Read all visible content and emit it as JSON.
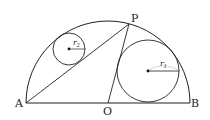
{
  "diagram": {
    "type": "geometry",
    "points": {
      "A": {
        "label": "A",
        "x": 26,
        "y": 103
      },
      "B": {
        "label": "B",
        "x": 190,
        "y": 103
      },
      "O": {
        "label": "O",
        "x": 108,
        "y": 103
      },
      "P": {
        "label": "P",
        "x": 129,
        "y": 24
      }
    },
    "semicircle": {
      "cx": 108,
      "cy": 103,
      "r": 82
    },
    "circles": [
      {
        "name": "small-circle",
        "cx": 69,
        "cy": 49,
        "r": 16,
        "radius_label": "r",
        "radius_sub": "2"
      },
      {
        "name": "large-circle",
        "cx": 148,
        "cy": 71,
        "r": 31,
        "radius_label": "r",
        "radius_sub": "1"
      }
    ],
    "segments": [
      {
        "from": "A",
        "to": "B"
      },
      {
        "from": "A",
        "to": "P"
      },
      {
        "from": "O",
        "to": "P"
      }
    ],
    "stroke_color": "#222222"
  }
}
